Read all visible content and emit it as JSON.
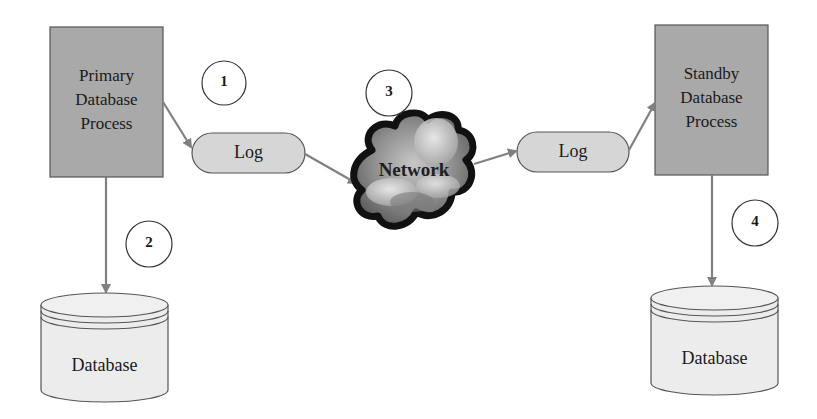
{
  "diagram": {
    "colors": {
      "process_fill": "#a9a9a9",
      "log_fill": "#d6d6d6",
      "db_fill": "#ececec",
      "stroke": "#555555",
      "arrow": "#808080",
      "cloud_outline": "#111111"
    },
    "nodes": {
      "primary_process": {
        "line1": "Primary",
        "line2": "Database",
        "line3": "Process"
      },
      "primary_log": {
        "label": "Log"
      },
      "network": {
        "label": "Network"
      },
      "standby_log": {
        "label": "Log"
      },
      "standby_process": {
        "line1": "Standby",
        "line2": "Database",
        "line3": "Process"
      },
      "primary_db": {
        "label": "Database"
      },
      "standby_db": {
        "label": "Database"
      }
    },
    "steps": [
      {
        "number": "1"
      },
      {
        "number": "2"
      },
      {
        "number": "3"
      },
      {
        "number": "4"
      }
    ],
    "edges": [
      {
        "from": "Primary Database Process",
        "to": "Log (primary)",
        "step": "1"
      },
      {
        "from": "Primary Database Process",
        "to": "Database (primary)",
        "step": "2"
      },
      {
        "from": "Log (primary)",
        "to": "Network",
        "step": "3"
      },
      {
        "from": "Network",
        "to": "Log (standby)"
      },
      {
        "from": "Log (standby)",
        "to": "Standby Database Process"
      },
      {
        "from": "Standby Database Process",
        "to": "Database (standby)",
        "step": "4"
      }
    ]
  }
}
